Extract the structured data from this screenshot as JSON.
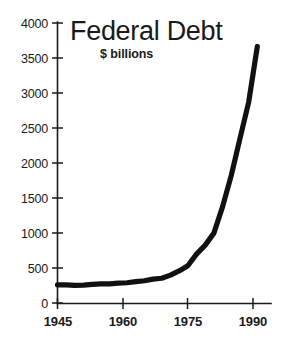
{
  "chart_data": {
    "type": "line",
    "title": "Federal Debt",
    "subtitle": "$ billions",
    "xlabel": "",
    "ylabel": "",
    "unit": "$ billions",
    "grid": false,
    "legend": "none",
    "xlim": [
      1945,
      1992
    ],
    "ylim": [
      0,
      4000
    ],
    "ytick_labels": [
      "4000",
      "3500",
      "3000",
      "2500",
      "2000",
      "1500",
      "1000",
      "500",
      "0"
    ],
    "yticks": [
      4000,
      3500,
      3000,
      2500,
      2000,
      1500,
      1000,
      500,
      0
    ],
    "xtick_labels": [
      "1945",
      "1960",
      "1975",
      "1990"
    ],
    "xticks": [
      1945,
      1960,
      1975,
      1990
    ],
    "series": [
      {
        "name": "Federal Debt",
        "color": "#111111",
        "x": [
          1945,
          1947,
          1949,
          1951,
          1953,
          1955,
          1957,
          1959,
          1961,
          1963,
          1965,
          1967,
          1969,
          1971,
          1973,
          1975,
          1977,
          1979,
          1981,
          1983,
          1985,
          1987,
          1989,
          1991
        ],
        "values": [
          260,
          258,
          253,
          255,
          266,
          274,
          272,
          285,
          289,
          306,
          318,
          341,
          354,
          398,
          458,
          533,
          699,
          827,
          998,
          1377,
          1823,
          2350,
          2868,
          3665
        ]
      }
    ],
    "annotations": []
  },
  "axes": {
    "y_axis_name": "y-axis",
    "x_axis_name": "x-axis"
  }
}
